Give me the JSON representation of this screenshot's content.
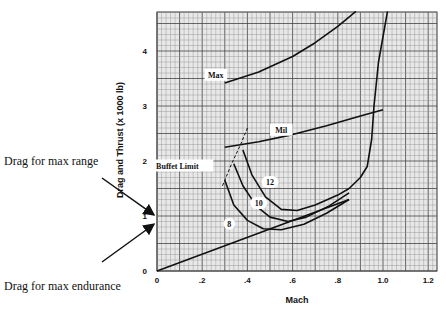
{
  "chart_data": {
    "type": "line",
    "title": "",
    "xlabel": "Mach",
    "ylabel": "Drag and Thrust (x 1000 lb)",
    "xlim": [
      0,
      1.25
    ],
    "ylim": [
      0,
      4.7
    ],
    "xticks": [
      0,
      0.2,
      0.4,
      0.6,
      0.8,
      1.0,
      1.2
    ],
    "xtick_labels": [
      "0",
      ".2",
      ".4",
      ".6",
      ".8",
      "1.0",
      "1.2"
    ],
    "yticks": [
      0,
      1,
      2,
      3,
      4
    ],
    "ytick_labels": [
      "0",
      "1",
      "2",
      "3",
      "4"
    ],
    "grid": true,
    "series": [
      {
        "name": "Max",
        "label": "Max",
        "label_at": [
          0.26,
          3.55
        ],
        "x": [
          0.3,
          0.45,
          0.6,
          0.7,
          0.8,
          0.88
        ],
        "y": [
          3.42,
          3.62,
          3.9,
          4.15,
          4.45,
          4.72
        ]
      },
      {
        "name": "Mil",
        "label": "Mil",
        "label_at": [
          0.55,
          2.55
        ],
        "x": [
          0.3,
          0.45,
          0.6,
          0.75,
          0.9,
          1.0
        ],
        "y": [
          2.25,
          2.35,
          2.48,
          2.64,
          2.82,
          2.93
        ]
      },
      {
        "name": "Drag (transonic rise)",
        "label": "",
        "x": [
          0.85,
          0.9,
          0.93,
          0.95,
          0.96,
          0.98,
          1.02
        ],
        "y": [
          1.5,
          1.7,
          1.9,
          2.4,
          3.0,
          3.8,
          4.72
        ]
      },
      {
        "name": "12",
        "label": "12",
        "label_at": [
          0.5,
          1.6
        ],
        "x": [
          0.38,
          0.42,
          0.48,
          0.55,
          0.62,
          0.7,
          0.8,
          0.85
        ],
        "y": [
          2.2,
          1.75,
          1.35,
          1.12,
          1.1,
          1.2,
          1.38,
          1.5
        ]
      },
      {
        "name": "10",
        "label": "10",
        "label_at": [
          0.45,
          1.22
        ],
        "x": [
          0.34,
          0.38,
          0.44,
          0.5,
          0.58,
          0.66,
          0.76,
          0.85
        ],
        "y": [
          1.95,
          1.55,
          1.18,
          0.98,
          0.9,
          0.98,
          1.18,
          1.42
        ]
      },
      {
        "name": "8",
        "label": "8",
        "label_at": [
          0.32,
          0.84
        ],
        "x": [
          0.3,
          0.34,
          0.4,
          0.47,
          0.55,
          0.65,
          0.75,
          0.85
        ],
        "y": [
          1.65,
          1.2,
          0.92,
          0.77,
          0.75,
          0.85,
          1.05,
          1.3
        ]
      },
      {
        "name": "Thrust line",
        "label": "",
        "x": [
          0,
          0.85
        ],
        "y": [
          0,
          1.3
        ]
      },
      {
        "name": "Buffet Limit",
        "label": "Buffet Limit",
        "label_at": [
          0.09,
          1.9
        ],
        "dashed": true,
        "x": [
          0.29,
          0.33,
          0.37,
          0.4
        ],
        "y": [
          1.55,
          1.95,
          2.3,
          2.6
        ]
      }
    ],
    "annotations": [
      {
        "text": "Drag for max range",
        "points_to": [
          0,
          1.02
        ]
      },
      {
        "text": "Drag for max endurance",
        "points_to": [
          0,
          0.85
        ]
      }
    ]
  }
}
